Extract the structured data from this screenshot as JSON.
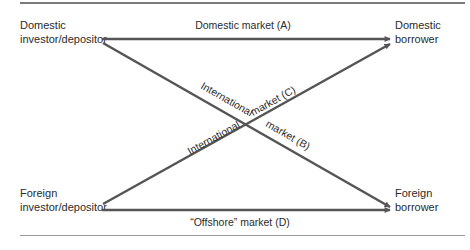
{
  "diagram": {
    "type": "flow-diagram",
    "colors": {
      "line": "#555555",
      "text": "#2b2b2b",
      "rule": "#7a7a7a"
    },
    "nodes": {
      "domestic_investor": {
        "line1": "Domestic",
        "line2": "investor/depositor"
      },
      "foreign_investor": {
        "line1": "Foreign",
        "line2": "investor/depositor"
      },
      "domestic_borrower": {
        "line1": "Domestic",
        "line2": "borrower"
      },
      "foreign_borrower": {
        "line1": "Foreign",
        "line2": "borrower"
      }
    },
    "edges": [
      {
        "id": "A",
        "from": "Domestic investor/depositor",
        "to": "Domestic borrower",
        "label": "Domestic market (A)"
      },
      {
        "id": "B",
        "from": "Domestic investor/depositor",
        "to": "Foreign borrower",
        "label_part1": "International",
        "label_part2": "market (B)"
      },
      {
        "id": "C",
        "from": "Foreign investor/depositor",
        "to": "Domestic borrower",
        "label_part1": "International",
        "label_part2": "market (C)"
      },
      {
        "id": "D",
        "from": "Foreign investor/depositor",
        "to": "Foreign borrower",
        "label": "“Offshore” market (D)"
      }
    ]
  }
}
